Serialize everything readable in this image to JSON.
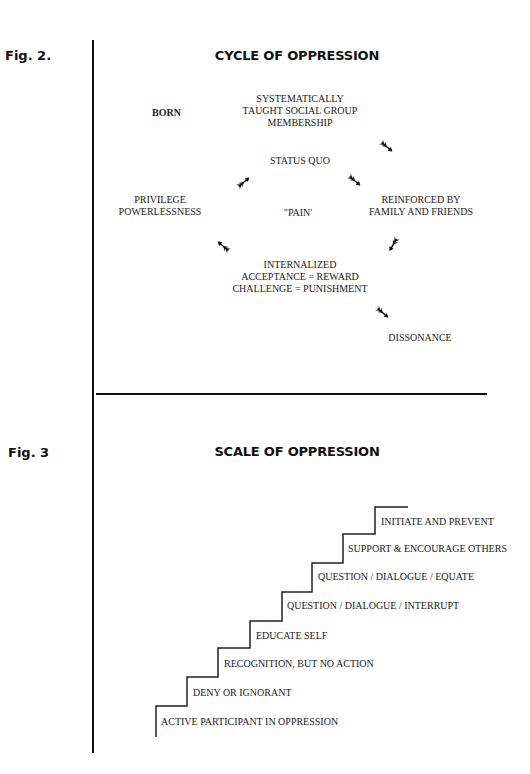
{
  "fig2": {
    "label": "Fig. 2.",
    "title": "CYCLE OF OPPRESSION",
    "nodes": {
      "born": "BORN",
      "taught_line1": "SYSTEMATICALLY",
      "taught_line2": "TAUGHT SOCIAL GROUP",
      "taught_line3": "MEMBERSHIP",
      "status_quo": "STATUS QUO",
      "privilege_line1": "PRIVILEGE",
      "privilege_line2": "POWERLESSNESS",
      "pain": "\"PAIN'",
      "reinforced_line1": "REINFORCED BY",
      "reinforced_line2": "FAMILY AND FRIENDS",
      "internalized_line1": "INTERNALIZED",
      "internalized_line2": "ACCEPTANCE = REWARD",
      "internalized_line3": "CHALLENGE = PUNISHMENT",
      "dissonance": "DISSONANCE"
    },
    "arrows": [
      {
        "name": "arrow-taught-to-reinforced",
        "direction": "down-right"
      },
      {
        "name": "arrow-statusquo-to-reinforced",
        "direction": "down-right"
      },
      {
        "name": "arrow-privilege-to-statusquo",
        "direction": "up-right"
      },
      {
        "name": "arrow-internalized-to-privilege",
        "direction": "up-left"
      },
      {
        "name": "arrow-reinforced-to-internalized",
        "direction": "down-left"
      },
      {
        "name": "arrow-internalized-to-dissonance",
        "direction": "down-right"
      }
    ]
  },
  "fig3": {
    "label": "Fig. 3",
    "title": "SCALE OF OPPRESSION",
    "steps": [
      "ACTIVE PARTICIPANT IN OPPRESSION",
      "DENY OR IGNORANT",
      "RECOGNITION, BUT NO ACTION",
      "EDUCATE SELF",
      "QUESTION / DIALOGUE / INTERRUPT",
      "QUESTION / DIALOGUE / EQUATE",
      "SUPPORT & ENCOURAGE OTHERS",
      "INITIATE AND PREVENT"
    ]
  }
}
